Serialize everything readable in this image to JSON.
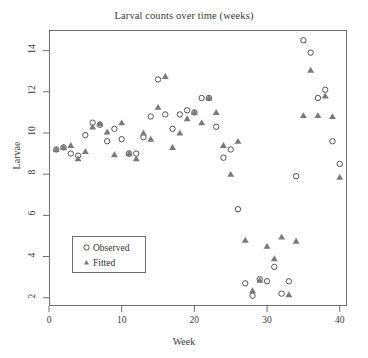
{
  "chart_data": {
    "type": "scatter",
    "title": "Larval counts over time (weeks)",
    "xlabel": "Week",
    "ylabel": "Larvae",
    "xlim": [
      0,
      41
    ],
    "ylim": [
      1.6,
      15.0
    ],
    "xticks": [
      0,
      10,
      20,
      30,
      40
    ],
    "yticks": [
      2,
      4,
      6,
      8,
      10,
      12,
      14
    ],
    "grid": false,
    "legend_position": "lower left",
    "x": [
      1,
      2,
      3,
      4,
      5,
      6,
      7,
      8,
      9,
      10,
      11,
      12,
      13,
      14,
      15,
      16,
      17,
      18,
      19,
      20,
      21,
      22,
      23,
      24,
      25,
      26,
      27,
      28,
      29,
      30,
      31,
      32,
      33,
      34,
      35,
      36,
      37,
      38,
      39,
      40
    ],
    "series": [
      {
        "name": "Observed",
        "marker": "open-circle",
        "color": "#4a4a4a",
        "values": [
          9.2,
          9.3,
          9.0,
          8.9,
          9.9,
          10.5,
          10.4,
          9.6,
          10.2,
          9.7,
          9.0,
          9.0,
          9.8,
          10.8,
          12.6,
          10.9,
          10.2,
          10.9,
          11.1,
          11.0,
          11.7,
          11.7,
          10.3,
          8.8,
          9.2,
          6.3,
          2.7,
          2.1,
          2.9,
          2.8,
          3.5,
          2.2,
          2.8,
          7.9,
          14.5,
          13.9,
          11.7,
          12.1,
          9.6,
          8.5
        ]
      },
      {
        "name": "Fitted",
        "marker": "filled-triangle",
        "color": "#7a7a7a",
        "values": [
          9.2,
          9.3,
          9.4,
          8.75,
          9.1,
          10.3,
          10.45,
          10.05,
          8.95,
          10.5,
          9.0,
          8.75,
          10.0,
          9.7,
          11.25,
          12.75,
          9.3,
          10.0,
          10.7,
          11.0,
          10.5,
          11.7,
          11.0,
          9.4,
          8.0,
          9.6,
          4.8,
          2.35,
          2.85,
          4.5,
          3.9,
          4.95,
          2.15,
          4.75,
          10.85,
          13.05,
          10.85,
          11.8,
          10.8,
          7.85
        ]
      }
    ]
  },
  "legend": {
    "items": [
      {
        "label": "Observed",
        "marker": "open-circle"
      },
      {
        "label": "Fitted",
        "marker": "filled-triangle"
      }
    ]
  }
}
